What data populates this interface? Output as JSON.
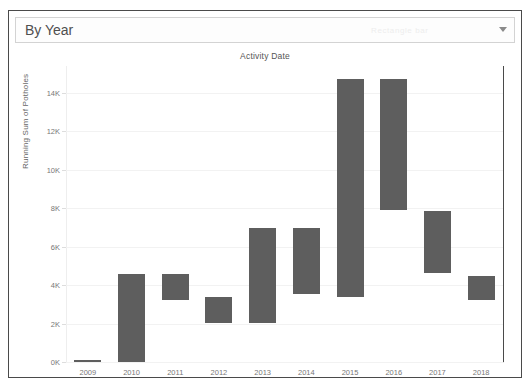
{
  "page": {
    "cropped_top_text": "·······················"
  },
  "header": {
    "selected_option": "By Year",
    "watermark": "Rectangle bar",
    "caret_icon": "chevron-down-icon",
    "options": [
      "By Year"
    ]
  },
  "chart_data": {
    "type": "bar",
    "title": "Activity Date",
    "xlabel": "",
    "ylabel": "Running Sum of Potholes",
    "categories": [
      "2009",
      "2010",
      "2011",
      "2012",
      "2013",
      "2014",
      "2015",
      "2016",
      "2017",
      "2018"
    ],
    "bar_style": "waterfall-gantt",
    "bar_color": "#5e5e5e",
    "ylim": [
      0,
      15400
    ],
    "yticks": [
      0,
      2000,
      4000,
      6000,
      8000,
      10000,
      12000,
      14000
    ],
    "ytick_labels": [
      "0K",
      "2K",
      "4K",
      "6K",
      "8K",
      "10K",
      "12K",
      "14K"
    ],
    "grid": true,
    "legend": "none",
    "bars": [
      {
        "category": "2009",
        "start": 0,
        "end": 100
      },
      {
        "category": "2010",
        "start": 0,
        "end": 4600
      },
      {
        "category": "2011",
        "start": 3250,
        "end": 4600
      },
      {
        "category": "2012",
        "start": 2020,
        "end": 3380
      },
      {
        "category": "2013",
        "start": 2020,
        "end": 6960
      },
      {
        "category": "2014",
        "start": 3560,
        "end": 6960
      },
      {
        "category": "2015",
        "start": 3400,
        "end": 14700
      },
      {
        "category": "2016",
        "start": 7900,
        "end": 14700
      },
      {
        "category": "2017",
        "start": 4620,
        "end": 7880
      },
      {
        "category": "2018",
        "start": 3250,
        "end": 4480
      }
    ]
  }
}
